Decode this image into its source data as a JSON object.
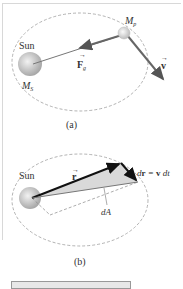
{
  "figure_a": {
    "sun_label": "Sun",
    "sun_mass_label": "M",
    "sun_mass_sub": "S",
    "planet_mass_label": "M",
    "planet_mass_sub": "p",
    "force_label": "F",
    "force_sub": "g",
    "velocity_label": "v",
    "caption": "(a)"
  },
  "figure_b": {
    "sun_label": "Sun",
    "r_label": "r",
    "dr_label": "d r = v dt",
    "area_label": "dA",
    "caption": "(b)"
  },
  "colors": {
    "orbit": "#9a9a9a",
    "sun": "#c8c8c8",
    "arrow": "#666666",
    "shade": "#d9d9d9"
  }
}
